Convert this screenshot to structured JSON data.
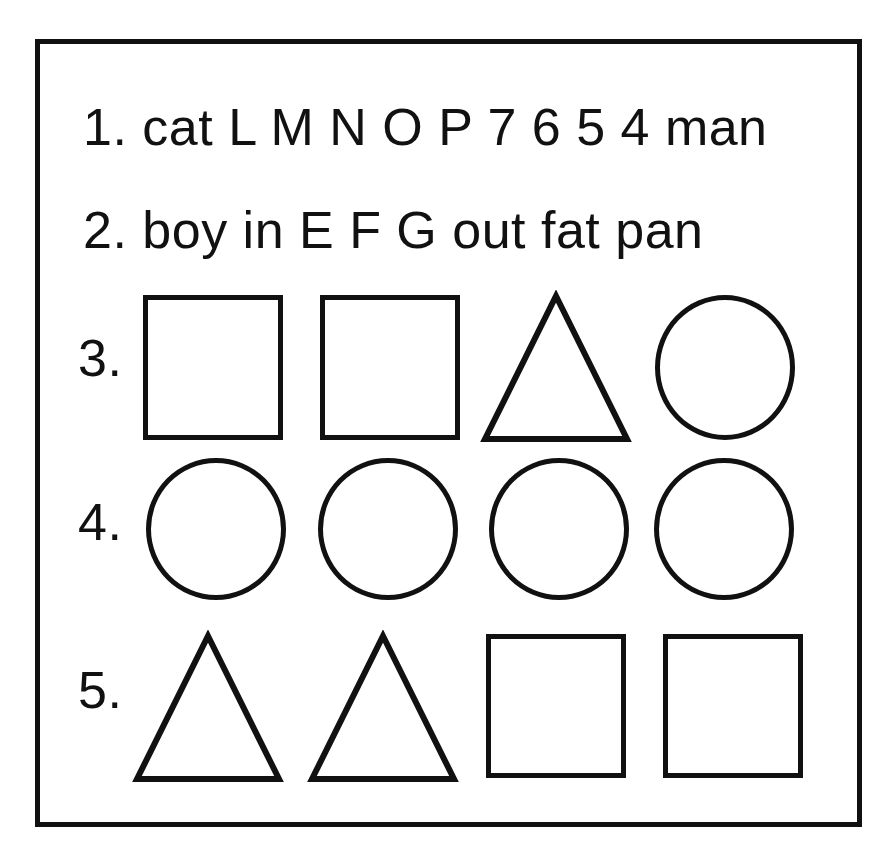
{
  "page": {
    "background_color": "#ffffff",
    "ink_color": "#111111",
    "frame": {
      "stroke_color": "#111111",
      "stroke_width": 5
    }
  },
  "items": [
    {
      "number": "1.",
      "kind": "text",
      "text": "1. cat L M N O P 7 6 5 4 man",
      "tokens": [
        "cat",
        "L",
        "M",
        "N",
        "O",
        "P",
        "7",
        "6",
        "5",
        "4",
        "man"
      ]
    },
    {
      "number": "2.",
      "kind": "text",
      "text": "2. boy in E F G out fat pan",
      "tokens": [
        "boy",
        "in",
        "E",
        "F",
        "G",
        "out",
        "fat",
        "pan"
      ]
    },
    {
      "number": "3.",
      "kind": "shapes",
      "shapes": [
        "square",
        "square",
        "triangle",
        "circle"
      ]
    },
    {
      "number": "4.",
      "kind": "shapes",
      "shapes": [
        "circle",
        "circle",
        "circle",
        "circle"
      ]
    },
    {
      "number": "5.",
      "kind": "shapes",
      "shapes": [
        "triangle",
        "triangle",
        "square",
        "square"
      ]
    }
  ]
}
